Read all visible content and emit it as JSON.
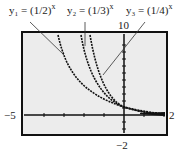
{
  "equations": [
    {
      "lhs": "y₁ =",
      "base": "1/2",
      "exp": "x"
    },
    {
      "lhs": "y₂ =",
      "base": "1/3",
      "exp": "x"
    },
    {
      "lhs": "y₃ =",
      "base": "1/4",
      "exp": "x"
    }
  ],
  "window": {
    "xmin": "−5",
    "xmax": "2",
    "ymin": "−2",
    "ymax": "10"
  },
  "colors": {
    "screen": "#ececec",
    "curve": "#111111"
  }
}
